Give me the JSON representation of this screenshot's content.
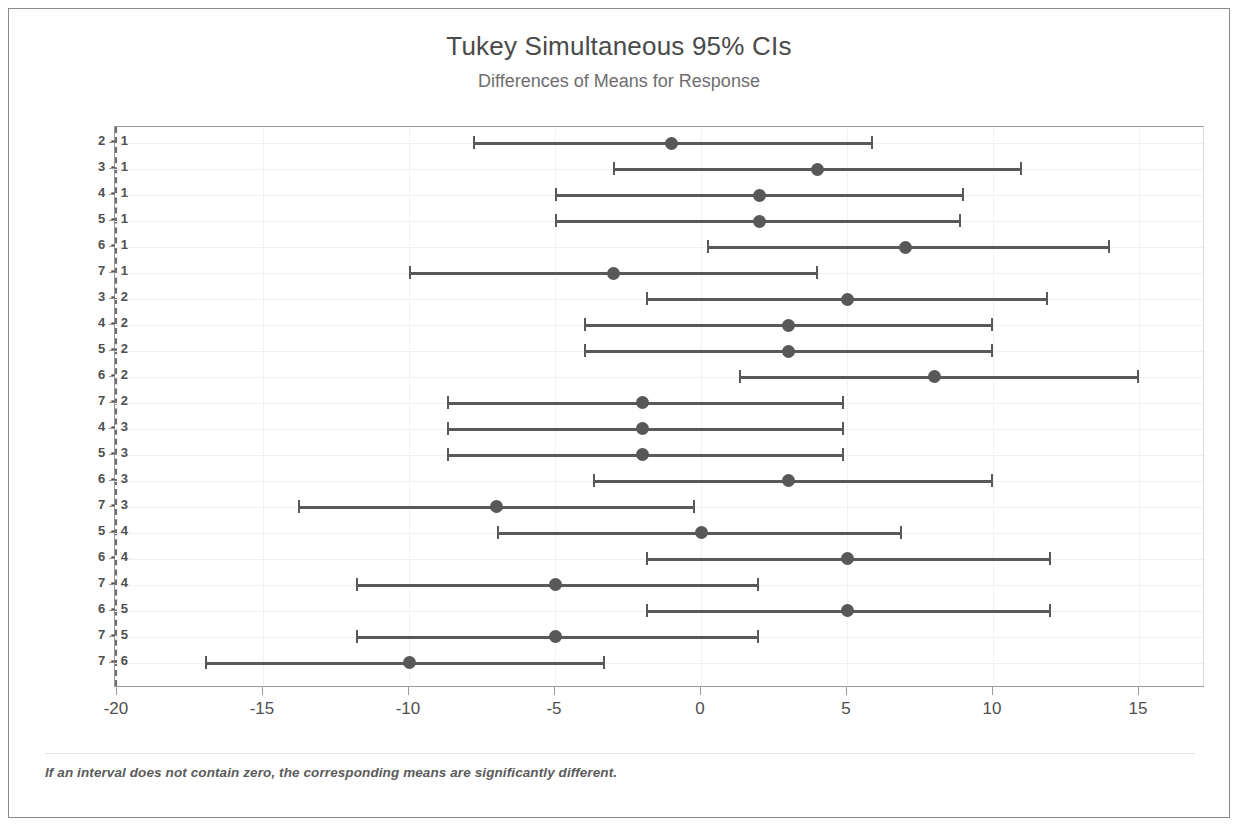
{
  "chart_data": {
    "type": "scatter",
    "title": "Tukey Simultaneous 95% CIs",
    "subtitle": "Differences of Means for Response",
    "xlabel": "",
    "ylabel": "",
    "xlim": [
      -22,
      17.5
    ],
    "grid": true,
    "legend": null,
    "footnote": "If an interval does not contain zero, the corresponding means are significantly different.",
    "reference_line": 0,
    "xticks": [
      -20,
      -15,
      -10,
      -5,
      0,
      5,
      10,
      15
    ],
    "xtick_labels": [
      "-20",
      "-15",
      "-10",
      "-5",
      "0",
      "5",
      "10",
      "15"
    ],
    "categories": [
      "2 - 1",
      "3 - 1",
      "4 - 1",
      "5 - 1",
      "6 - 1",
      "7 - 1",
      "3 - 2",
      "4 - 2",
      "5 - 2",
      "6 - 2",
      "7 - 2",
      "4 - 3",
      "5 - 3",
      "6 - 3",
      "7 - 3",
      "5 - 4",
      "6 - 4",
      "7 - 4",
      "6 - 5",
      "7 - 5",
      "7 - 6"
    ],
    "intervals": [
      {
        "label": "2 - 1",
        "center": -1,
        "lower": -7.8,
        "upper": 5.9
      },
      {
        "label": "3 - 1",
        "center": 4,
        "lower": -3.0,
        "upper": 11.0
      },
      {
        "label": "4 - 1",
        "center": 2,
        "lower": -5.0,
        "upper": 9.0
      },
      {
        "label": "5 - 1",
        "center": 2,
        "lower": -5.0,
        "upper": 8.9
      },
      {
        "label": "6 - 1",
        "center": 7,
        "lower": 0.2,
        "upper": 14.0
      },
      {
        "label": "7 - 1",
        "center": -3,
        "lower": -10.0,
        "upper": 4.0
      },
      {
        "label": "3 - 2",
        "center": 5,
        "lower": -1.9,
        "upper": 11.9
      },
      {
        "label": "4 - 2",
        "center": 3,
        "lower": -4.0,
        "upper": 10.0
      },
      {
        "label": "5 - 2",
        "center": 3,
        "lower": -4.0,
        "upper": 10.0
      },
      {
        "label": "6 - 2",
        "center": 8,
        "lower": 1.3,
        "upper": 15.0
      },
      {
        "label": "7 - 2",
        "center": -2,
        "lower": -8.7,
        "upper": 4.9
      },
      {
        "label": "4 - 3",
        "center": -2,
        "lower": -8.7,
        "upper": 4.9
      },
      {
        "label": "5 - 3",
        "center": -2,
        "lower": -8.7,
        "upper": 4.9
      },
      {
        "label": "6 - 3",
        "center": 3,
        "lower": -3.7,
        "upper": 10.0
      },
      {
        "label": "7 - 3",
        "center": -7,
        "lower": -13.8,
        "upper": -0.2
      },
      {
        "label": "5 - 4",
        "center": 0,
        "lower": -7.0,
        "upper": 6.9
      },
      {
        "label": "6 - 4",
        "center": 5,
        "lower": -1.9,
        "upper": 12.0
      },
      {
        "label": "7 - 4",
        "center": -5,
        "lower": -11.8,
        "upper": 2.0
      },
      {
        "label": "6 - 5",
        "center": 5,
        "lower": -1.9,
        "upper": 12.0
      },
      {
        "label": "7 - 5",
        "center": -5,
        "lower": -11.8,
        "upper": 2.0
      },
      {
        "label": "7 - 6",
        "center": -10,
        "lower": -17.0,
        "upper": -3.3
      }
    ],
    "colors": {
      "point": "#585858",
      "interval": "#595959",
      "reference": "#6d6d6d",
      "grid": "#f0f0f0",
      "axis": "#9a9a9a",
      "title": "#4a4a4a",
      "subtitle": "#6e6e6e"
    }
  }
}
